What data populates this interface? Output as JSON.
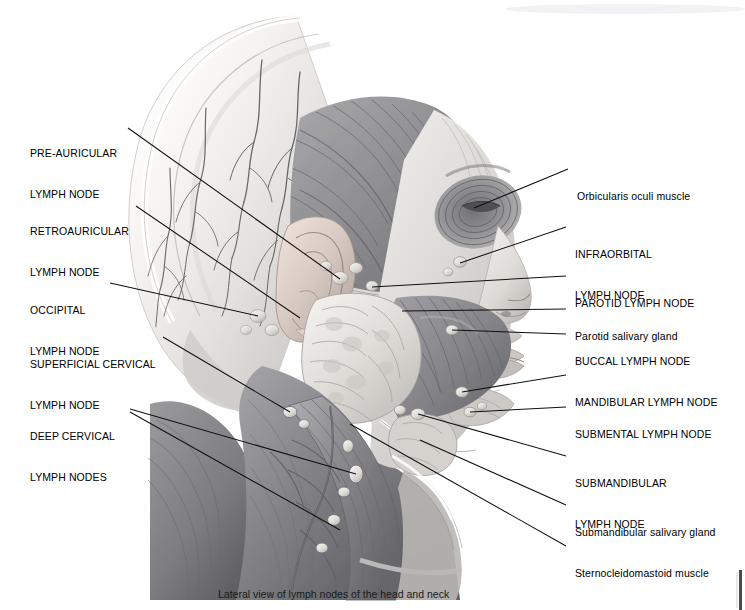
{
  "figure": {
    "caption": "Lateral view of lymph nodes of the head and neck",
    "top_cut_text": "                                                                                                                         ",
    "alt": "Grayscale lateral anatomical illustration of the human head and neck showing superficial musculature, scalp vessels, salivary glands and the chain of lymph nodes"
  },
  "labels_left": [
    {
      "id": "pre-auricular-lymph-node",
      "line1": "PRE-AURICULAR",
      "line2": "LYMPH NODE",
      "style": "caps"
    },
    {
      "id": "retroauricular-lymph-node",
      "line1": "RETROAURICULAR",
      "line2": "LYMPH NODE",
      "style": "caps"
    },
    {
      "id": "occipital-lymph-node",
      "line1": "OCCIPITAL",
      "line2": "LYMPH NODE",
      "style": "caps"
    },
    {
      "id": "superficial-cervical-lymph-node",
      "line1": "SUPERFICIAL CERVICAL",
      "line2": "LYMPH NODE",
      "style": "caps"
    },
    {
      "id": "deep-cervical-lymph-nodes",
      "line1": "DEEP CERVICAL",
      "line2": "LYMPH NODES",
      "style": "caps"
    }
  ],
  "labels_right": [
    {
      "id": "orbicularis-oculi-muscle",
      "line1": "Orbicularis oculi muscle",
      "line2": "",
      "style": "mixed"
    },
    {
      "id": "infraorbital-lymph-node",
      "line1": "INFRAORBITAL",
      "line2": "LYMPH NODE",
      "style": "caps"
    },
    {
      "id": "parotid-lymph-node",
      "line1": "PAROTID LYMPH NODE",
      "line2": "",
      "style": "caps"
    },
    {
      "id": "parotid-salivary-gland",
      "line1": "Parotid salivary gland",
      "line2": "",
      "style": "mixed"
    },
    {
      "id": "buccal-lymph-node",
      "line1": "BUCCAL LYMPH NODE",
      "line2": "",
      "style": "caps"
    },
    {
      "id": "mandibular-lymph-node",
      "line1": "MANDIBULAR LYMPH NODE",
      "line2": "",
      "style": "caps"
    },
    {
      "id": "submental-lymph-node",
      "line1": "SUBMENTAL LYMPH NODE",
      "line2": "",
      "style": "caps"
    },
    {
      "id": "submandibular-lymph-node",
      "line1": "SUBMANDIBULAR",
      "line2": "LYMPH NODE",
      "style": "caps"
    },
    {
      "id": "submandibular-salivary-gland",
      "line1": "Submandibular salivary gland",
      "line2": "",
      "style": "mixed"
    },
    {
      "id": "sternocleidomastoid-muscle",
      "line1": "Sternocleidomastoid muscle",
      "line2": "",
      "style": "mixed"
    }
  ],
  "colors": {
    "background": "#ffffff",
    "text": "#000000",
    "leader_line": "#111111",
    "skin_light": "#f3f1ef",
    "skin_mid": "#d8d5d2",
    "muscle_mid": "#9a9a9c",
    "muscle_dark": "#6f6f73",
    "muscle_deep": "#55555a",
    "node_light": "#e4e2df",
    "gland_light": "#dedcd9",
    "vessel": "#5d5d61",
    "edge_bar": "#4a4a50"
  }
}
